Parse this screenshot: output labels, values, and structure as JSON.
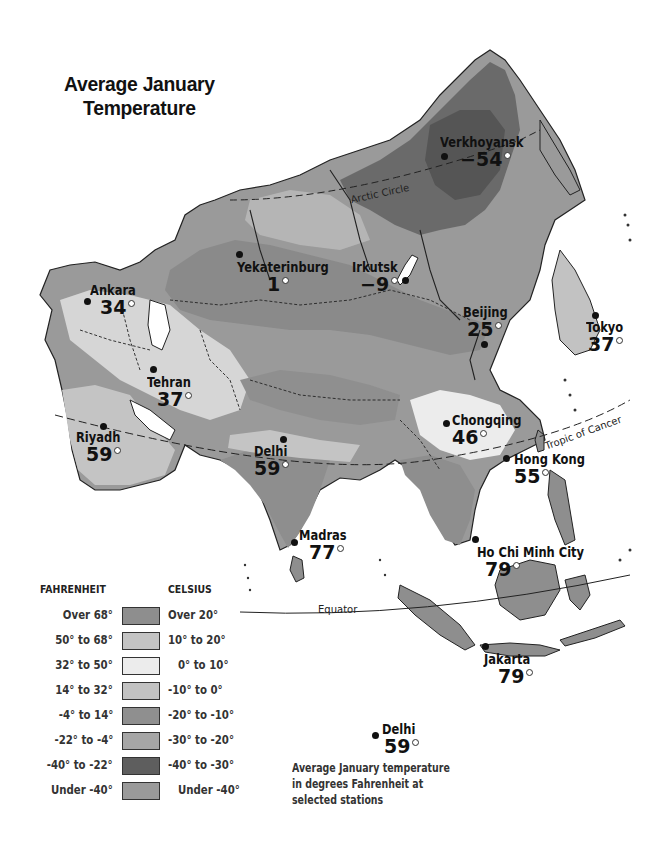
{
  "title": "Average January Temperature",
  "title_lines": [
    "Average January",
    "Temperature"
  ],
  "reference_lines": {
    "arctic_circle": "Arctic Circle",
    "tropic_of_cancer": "Tropic of Cancer",
    "equator": "Equator"
  },
  "stations": [
    {
      "name": "Verkhoyansk",
      "temp": "−54",
      "unit": "°F"
    },
    {
      "name": "Yekaterinburg",
      "temp": "1",
      "unit": "°F"
    },
    {
      "name": "Irkutsk",
      "temp": "−9",
      "unit": "°F"
    },
    {
      "name": "Ankara",
      "temp": "34",
      "unit": "°F"
    },
    {
      "name": "Beijing",
      "temp": "25",
      "unit": "°F"
    },
    {
      "name": "Tokyo",
      "temp": "37",
      "unit": "°F"
    },
    {
      "name": "Tehran",
      "temp": "37",
      "unit": "°F"
    },
    {
      "name": "Chongqing",
      "temp": "46",
      "unit": "°F"
    },
    {
      "name": "Riyadh",
      "temp": "59",
      "unit": "°F"
    },
    {
      "name": "Delhi",
      "temp": "59",
      "unit": "°F"
    },
    {
      "name": "Hong Kong",
      "temp": "55",
      "unit": "°F"
    },
    {
      "name": "Madras",
      "temp": "77",
      "unit": "°F"
    },
    {
      "name": "Ho Chi Minh City",
      "temp": "79",
      "unit": "°F"
    },
    {
      "name": "Jakarta",
      "temp": "79",
      "unit": "°F"
    }
  ],
  "legend": {
    "fahrenheit_header": "FAHRENHEIT",
    "celsius_header": "CELSIUS",
    "rows": [
      {
        "fahrenheit": "Over 68°",
        "celsius": "Over 20°",
        "color": "#8e8e8e"
      },
      {
        "fahrenheit": "50° to 68°",
        "celsius": "10° to 20°",
        "color": "#c4c4c4"
      },
      {
        "fahrenheit": "32° to 50°",
        "celsius": "0° to 10°",
        "color": "#ececec"
      },
      {
        "fahrenheit": "14° to 32°",
        "celsius": "-10° to 0°",
        "color": "#c2c2c2"
      },
      {
        "fahrenheit": "-4° to 14°",
        "celsius": "-20° to -10°",
        "color": "#8f8f8f"
      },
      {
        "fahrenheit": "-22° to -4°",
        "celsius": "-30° to -20°",
        "color": "#a6a6a6"
      },
      {
        "fahrenheit": "-40° to -22°",
        "celsius": "-40° to -30°",
        "color": "#5e5e5e"
      },
      {
        "fahrenheit": "Under -40°",
        "celsius": "Under -40°",
        "color": "#9a9a9a"
      }
    ]
  },
  "key": {
    "example_station": "Delhi",
    "example_temp": "59",
    "description_lines": [
      "Average January temperature",
      "in degrees Fahrenheit at",
      "selected stations"
    ]
  }
}
